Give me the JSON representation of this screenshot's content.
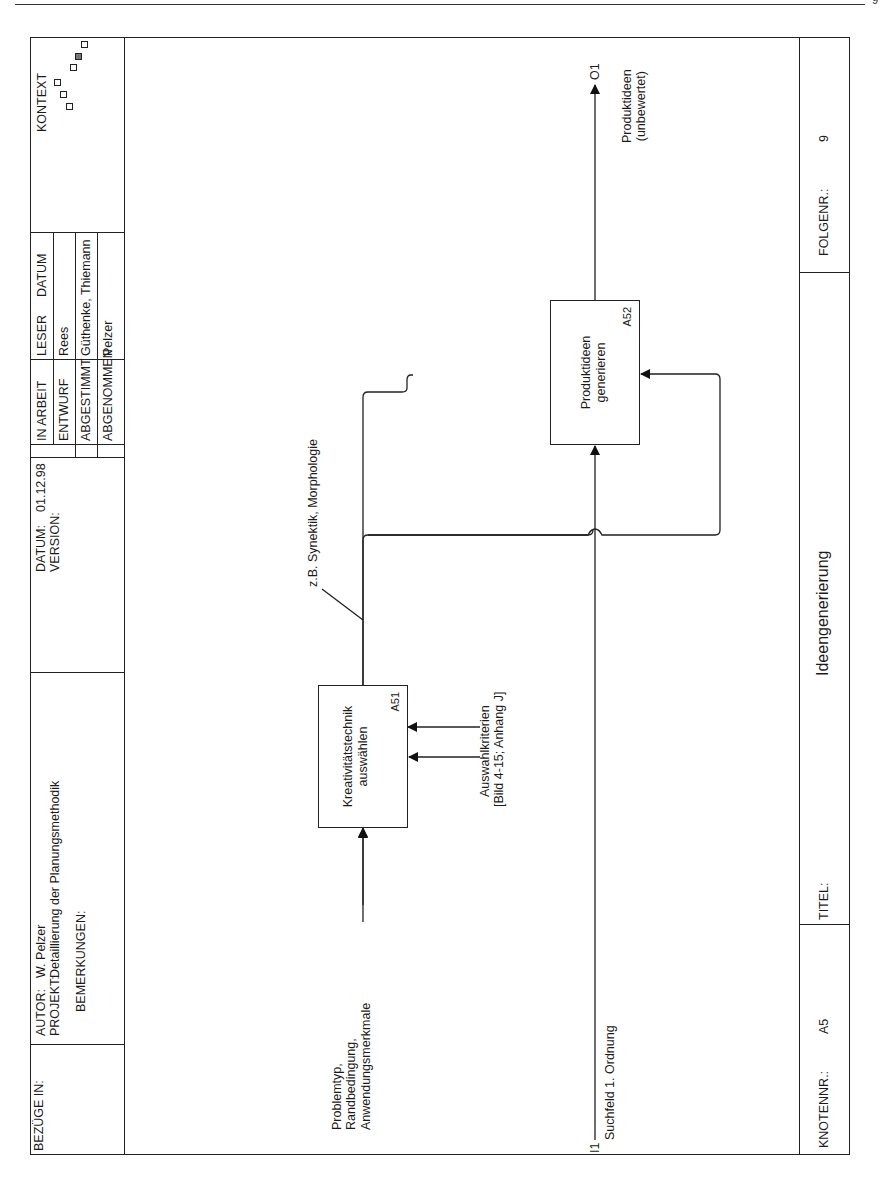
{
  "page": {
    "page_mark": "9"
  },
  "header": {
    "bezuege_label": "BEZÜGE IN:",
    "autor_label": "AUTOR:",
    "autor_value": "W. Pelzer",
    "projekt_label": "PROJEKT:",
    "projekt_value": "Detaillierung der Planungsmethodik",
    "bemerkungen_label": "BEMERKUNGEN:",
    "datum_label": "DATUM:",
    "datum_value": "01.12.98",
    "version_label": "VERSION:",
    "status_rows": [
      {
        "label": "IN ARBEIT"
      },
      {
        "label": "ENTWURF"
      },
      {
        "label": "ABGESTIMMT"
      },
      {
        "label": "ABGENOMMEN"
      }
    ],
    "leser_label": "LESER",
    "datum2_label": "DATUM",
    "leser_rows": [
      "",
      "Rees",
      "Güthenke, Thiemann",
      "Pelzer"
    ],
    "kontext_label": "KONTEXT"
  },
  "diagram": {
    "boxes": [
      {
        "id": "A51",
        "label_line1": "Kreativitätstechnik",
        "label_line2": "auswählen"
      },
      {
        "id": "A52",
        "label_line1": "Produktideen",
        "label_line2": "generieren"
      }
    ],
    "arrows": {
      "input_a51": {
        "line1": "Problemtyp,",
        "line2": "Randbedingung,",
        "line3": "Anwendungsmerkmale"
      },
      "control_a51": {
        "line1": "Auswahlkriterien",
        "line2": "[Bild 4-15; Anhang J]"
      },
      "mechanism_note": "z.B. Synektik, Morphologie",
      "input_i1": {
        "code": "I1",
        "label": "Suchfeld 1. Ordnung"
      },
      "output_o1": {
        "code": "O1",
        "line1": "Produktideen",
        "line2": "(unbewertet)"
      }
    }
  },
  "footer": {
    "knotennr_label": "KNOTENNR.:",
    "knotennr_value": "A5",
    "titel_label": "TITEL:",
    "titel_value": "Ideengenerierung",
    "folgenr_label": "FOLGENR.:",
    "folgenr_value": "9"
  },
  "colors": {
    "ink": "#1a1a1a",
    "paper": "#ffffff",
    "context_filled": "#777777"
  }
}
